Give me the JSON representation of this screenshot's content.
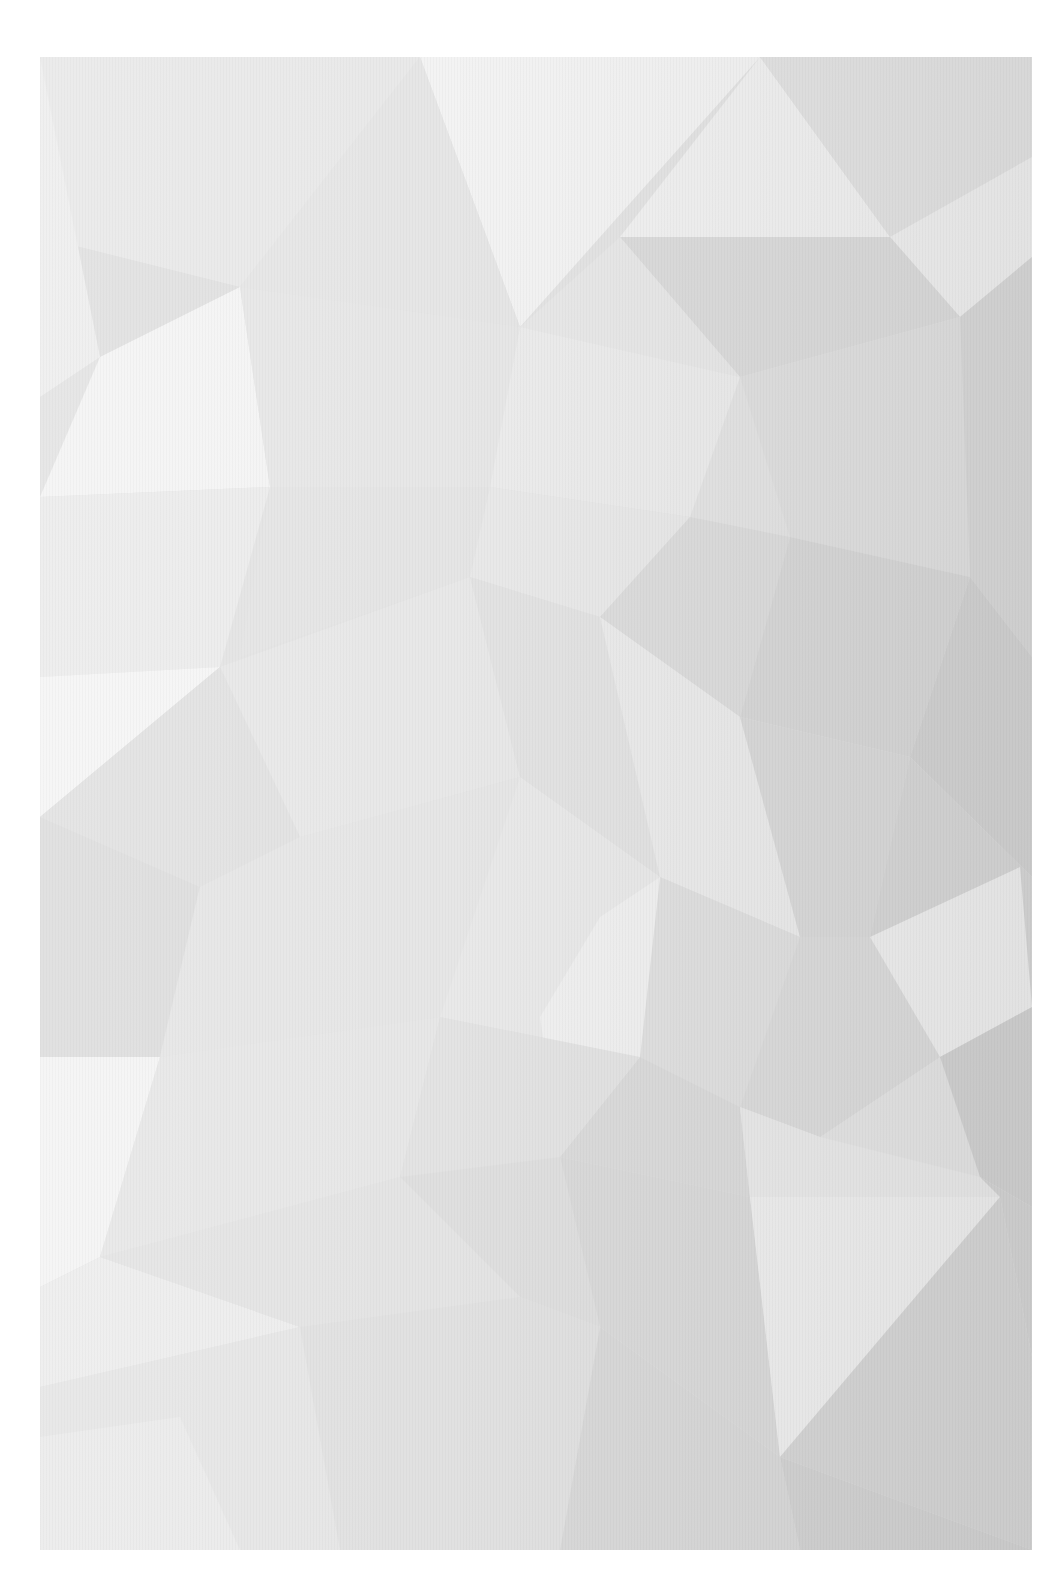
{
  "image": {
    "description": "Abstract low-poly geometric background in light grey tones, printed/scanned with white margins",
    "palette": {
      "margin": "#ffffff",
      "lightest": "#f4f4f4",
      "light": "#ececec",
      "mid": "#e2e2e2",
      "dark": "#d6d6d6",
      "darkest": "#cdcdcd"
    }
  }
}
